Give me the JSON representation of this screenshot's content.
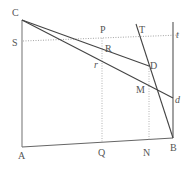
{
  "diagram": {
    "type": "geometry",
    "points": {
      "C": {
        "label": "C",
        "x": 22,
        "y": 20,
        "lx": 12,
        "ly": 16
      },
      "S": {
        "label": "S",
        "x": 22,
        "y": 41,
        "lx": 12,
        "ly": 46
      },
      "A": {
        "label": "A",
        "x": 22,
        "y": 147,
        "lx": 18,
        "ly": 159
      },
      "B": {
        "label": "B",
        "x": 173,
        "y": 138,
        "lx": 170,
        "ly": 151
      },
      "P": {
        "label": "P",
        "x": 102,
        "y": 38,
        "lx": 100,
        "ly": 33
      },
      "T": {
        "label": "T",
        "x": 136,
        "y": 24,
        "lx": 139,
        "ly": 33
      },
      "t": {
        "label": "t",
        "x": 173,
        "y": 38,
        "lx": 176,
        "ly": 38
      },
      "R": {
        "label": "R",
        "x": 107,
        "y": 52,
        "lx": 105,
        "ly": 52
      },
      "D": {
        "label": "D",
        "x": 149,
        "y": 66,
        "lx": 150,
        "ly": 69
      },
      "r": {
        "label": "r",
        "x": 102,
        "y": 64,
        "lx": 94,
        "ly": 68
      },
      "M": {
        "label": "M",
        "x": 152,
        "y": 88,
        "lx": 136,
        "ly": 93
      },
      "d": {
        "label": "d",
        "x": 173,
        "y": 98,
        "lx": 175,
        "ly": 103
      },
      "Q": {
        "label": "Q",
        "x": 102,
        "y": 142,
        "lx": 98,
        "ly": 156
      },
      "N": {
        "label": "N",
        "x": 149,
        "y": 140,
        "lx": 143,
        "ly": 156
      }
    },
    "colors": {
      "solid": "#444444",
      "frame": "#888888",
      "dotted": "#999999",
      "label": "#555555"
    }
  }
}
